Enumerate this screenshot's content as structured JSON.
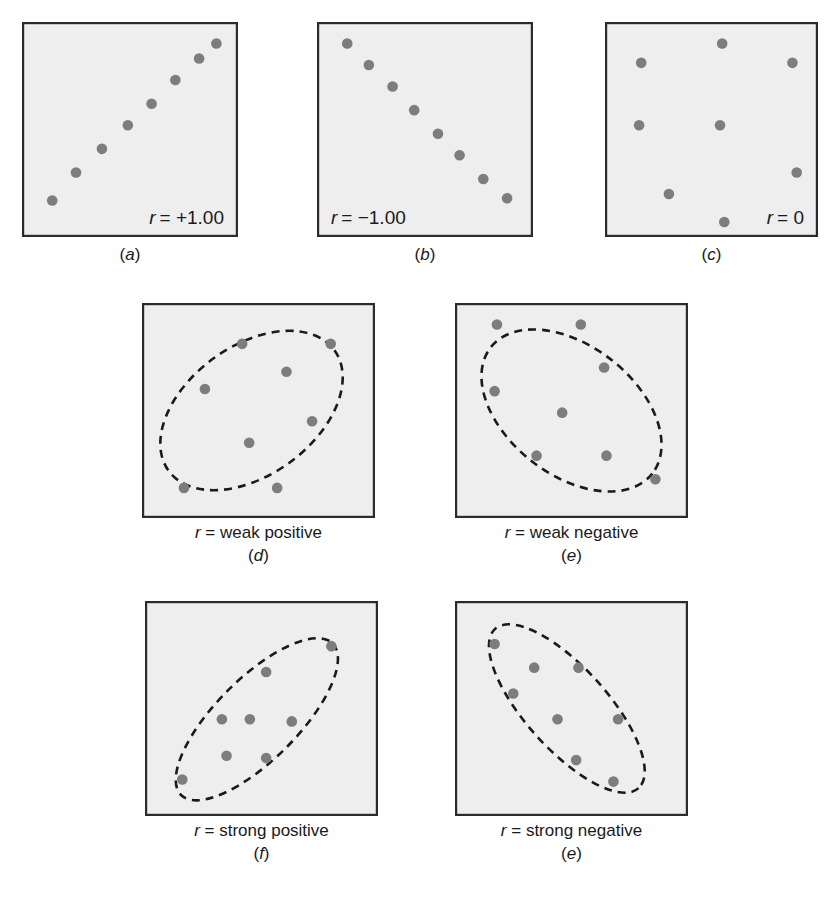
{
  "figure": {
    "panel_fill": "#eeeeee",
    "panel_border": "#2b2b2b",
    "dot_color": "#7d7d7d",
    "ellipse_color": "#1a1a1a",
    "background": "#ffffff"
  },
  "panels": [
    {
      "id": "a",
      "letter": "(a)",
      "letter_italic": "a",
      "inside_label_var": "r",
      "inside_label_value": "= +1.00",
      "inside_label_full": "r = +1.00",
      "inside_label_pos": "bottom-right",
      "desc": "",
      "ellipse": null,
      "box": {
        "x": 22,
        "y": 22,
        "w": 216,
        "h": 215
      },
      "points": [
        {
          "x": 0.14,
          "y": 0.83
        },
        {
          "x": 0.25,
          "y": 0.7
        },
        {
          "x": 0.37,
          "y": 0.59
        },
        {
          "x": 0.49,
          "y": 0.48
        },
        {
          "x": 0.6,
          "y": 0.38
        },
        {
          "x": 0.71,
          "y": 0.27
        },
        {
          "x": 0.82,
          "y": 0.17
        },
        {
          "x": 0.9,
          "y": 0.1
        }
      ]
    },
    {
      "id": "b",
      "letter": "(b)",
      "letter_italic": "b",
      "inside_label_var": "r",
      "inside_label_value": "= −1.00",
      "inside_label_full": "r = −1.00",
      "inside_label_pos": "bottom-left",
      "desc": "",
      "ellipse": null,
      "box": {
        "x": 317,
        "y": 22,
        "w": 216,
        "h": 215
      },
      "points": [
        {
          "x": 0.14,
          "y": 0.1
        },
        {
          "x": 0.24,
          "y": 0.2
        },
        {
          "x": 0.35,
          "y": 0.3
        },
        {
          "x": 0.45,
          "y": 0.41
        },
        {
          "x": 0.56,
          "y": 0.52
        },
        {
          "x": 0.66,
          "y": 0.62
        },
        {
          "x": 0.77,
          "y": 0.73
        },
        {
          "x": 0.88,
          "y": 0.82
        }
      ]
    },
    {
      "id": "c",
      "letter": "(c)",
      "letter_italic": "c",
      "inside_label_var": "r",
      "inside_label_value": "= 0",
      "inside_label_full": "r = 0",
      "inside_label_pos": "bottom-right",
      "desc": "",
      "ellipse": null,
      "box": {
        "x": 605,
        "y": 22,
        "w": 213,
        "h": 215
      },
      "points": [
        {
          "x": 0.55,
          "y": 0.1
        },
        {
          "x": 0.17,
          "y": 0.19
        },
        {
          "x": 0.88,
          "y": 0.19
        },
        {
          "x": 0.16,
          "y": 0.48
        },
        {
          "x": 0.54,
          "y": 0.48
        },
        {
          "x": 0.9,
          "y": 0.7
        },
        {
          "x": 0.3,
          "y": 0.8
        },
        {
          "x": 0.56,
          "y": 0.93
        }
      ]
    },
    {
      "id": "d",
      "letter": "(d)",
      "letter_italic": "d",
      "inside_label_var": "",
      "inside_label_value": "",
      "inside_label_full": "",
      "inside_label_pos": "none",
      "desc_var": "r",
      "desc_value": "= weak positive",
      "desc": "r = weak positive",
      "ellipse": {
        "cx": 0.47,
        "cy": 0.5,
        "rx": 0.44,
        "ry": 0.3,
        "rot": -36
      },
      "box": {
        "x": 142,
        "y": 303,
        "w": 233,
        "h": 215
      },
      "points": [
        {
          "x": 0.43,
          "y": 0.19
        },
        {
          "x": 0.81,
          "y": 0.19
        },
        {
          "x": 0.62,
          "y": 0.32
        },
        {
          "x": 0.27,
          "y": 0.4
        },
        {
          "x": 0.73,
          "y": 0.55
        },
        {
          "x": 0.46,
          "y": 0.65
        },
        {
          "x": 0.18,
          "y": 0.86
        },
        {
          "x": 0.58,
          "y": 0.86
        }
      ]
    },
    {
      "id": "e",
      "letter": "(e)",
      "letter_italic": "e",
      "inside_label_var": "",
      "inside_label_value": "",
      "inside_label_full": "",
      "inside_label_pos": "none",
      "desc_var": "r",
      "desc_value": "= weak negative",
      "desc": "r = weak negative",
      "ellipse": {
        "cx": 0.5,
        "cy": 0.5,
        "rx": 0.44,
        "ry": 0.3,
        "rot": 38
      },
      "box": {
        "x": 455,
        "y": 303,
        "w": 233,
        "h": 215
      },
      "points": [
        {
          "x": 0.18,
          "y": 0.1
        },
        {
          "x": 0.54,
          "y": 0.1
        },
        {
          "x": 0.64,
          "y": 0.3
        },
        {
          "x": 0.17,
          "y": 0.41
        },
        {
          "x": 0.46,
          "y": 0.51
        },
        {
          "x": 0.35,
          "y": 0.71
        },
        {
          "x": 0.65,
          "y": 0.71
        },
        {
          "x": 0.86,
          "y": 0.82
        }
      ]
    },
    {
      "id": "f",
      "letter": "(f)",
      "letter_italic": "f",
      "inside_label_var": "",
      "inside_label_value": "",
      "inside_label_full": "",
      "inside_label_pos": "none",
      "desc_var": "r",
      "desc_value": "= strong positive",
      "desc": "r = strong positive",
      "ellipse": {
        "cx": 0.48,
        "cy": 0.55,
        "rx": 0.46,
        "ry": 0.19,
        "rot": -45
      },
      "box": {
        "x": 145,
        "y": 601,
        "w": 233,
        "h": 215
      },
      "points": [
        {
          "x": 0.8,
          "y": 0.21
        },
        {
          "x": 0.52,
          "y": 0.33
        },
        {
          "x": 0.33,
          "y": 0.55
        },
        {
          "x": 0.45,
          "y": 0.55
        },
        {
          "x": 0.63,
          "y": 0.56
        },
        {
          "x": 0.35,
          "y": 0.72
        },
        {
          "x": 0.52,
          "y": 0.73
        },
        {
          "x": 0.16,
          "y": 0.83
        }
      ]
    },
    {
      "id": "g",
      "letter": "(e)",
      "letter_italic": "e",
      "inside_label_var": "",
      "inside_label_value": "",
      "inside_label_full": "",
      "inside_label_pos": "none",
      "desc_var": "r",
      "desc_value": "= strong negative",
      "desc": "r = strong negative",
      "ellipse": {
        "cx": 0.48,
        "cy": 0.5,
        "rx": 0.46,
        "ry": 0.19,
        "rot": 48
      },
      "box": {
        "x": 455,
        "y": 601,
        "w": 233,
        "h": 215
      },
      "points": [
        {
          "x": 0.17,
          "y": 0.2
        },
        {
          "x": 0.34,
          "y": 0.31
        },
        {
          "x": 0.53,
          "y": 0.31
        },
        {
          "x": 0.25,
          "y": 0.43
        },
        {
          "x": 0.44,
          "y": 0.55
        },
        {
          "x": 0.7,
          "y": 0.55
        },
        {
          "x": 0.52,
          "y": 0.74
        },
        {
          "x": 0.68,
          "y": 0.84
        }
      ]
    }
  ],
  "chart_data": {
    "type": "scatter",
    "xlabel": "",
    "ylabel": "",
    "xlim": [
      0,
      1
    ],
    "ylim": [
      0,
      1
    ],
    "grid": false,
    "legend": "none",
    "panels": [
      {
        "label": "(a)",
        "annotation": "r = +1.00",
        "r_value": 1.0,
        "n_points": 8,
        "x": [
          0.14,
          0.25,
          0.37,
          0.49,
          0.6,
          0.71,
          0.82,
          0.9
        ],
        "y": [
          0.17,
          0.3,
          0.41,
          0.52,
          0.62,
          0.73,
          0.83,
          0.9
        ],
        "envelope": null
      },
      {
        "label": "(b)",
        "annotation": "r = −1.00",
        "r_value": -1.0,
        "n_points": 8,
        "x": [
          0.14,
          0.24,
          0.35,
          0.45,
          0.56,
          0.66,
          0.77,
          0.88
        ],
        "y": [
          0.9,
          0.8,
          0.7,
          0.59,
          0.48,
          0.38,
          0.27,
          0.18
        ],
        "envelope": null
      },
      {
        "label": "(c)",
        "annotation": "r = 0",
        "r_value": 0.0,
        "n_points": 8,
        "x": [
          0.55,
          0.17,
          0.88,
          0.16,
          0.54,
          0.9,
          0.3,
          0.56
        ],
        "y": [
          0.9,
          0.81,
          0.81,
          0.52,
          0.52,
          0.3,
          0.2,
          0.07
        ],
        "envelope": null
      },
      {
        "label": "(d)",
        "annotation": "r = weak positive",
        "r_value": 0.45,
        "n_points": 8,
        "x": [
          0.43,
          0.81,
          0.62,
          0.27,
          0.73,
          0.46,
          0.18,
          0.58
        ],
        "y": [
          0.81,
          0.81,
          0.68,
          0.6,
          0.45,
          0.35,
          0.14,
          0.14
        ],
        "envelope": "dashed ellipse, positive tilt, wide"
      },
      {
        "label": "(e)",
        "annotation": "r = weak negative",
        "r_value": -0.45,
        "n_points": 8,
        "x": [
          0.18,
          0.54,
          0.64,
          0.17,
          0.46,
          0.35,
          0.65,
          0.86
        ],
        "y": [
          0.9,
          0.9,
          0.7,
          0.59,
          0.49,
          0.29,
          0.29,
          0.18
        ],
        "envelope": "dashed ellipse, negative tilt, wide"
      },
      {
        "label": "(f)",
        "annotation": "r = strong positive",
        "r_value": 0.9,
        "n_points": 8,
        "x": [
          0.8,
          0.52,
          0.33,
          0.45,
          0.63,
          0.35,
          0.52,
          0.16
        ],
        "y": [
          0.79,
          0.67,
          0.45,
          0.45,
          0.44,
          0.28,
          0.27,
          0.17
        ],
        "envelope": "dashed ellipse, positive tilt, narrow"
      },
      {
        "label": "(e)",
        "annotation": "r = strong negative",
        "r_value": -0.9,
        "n_points": 8,
        "x": [
          0.17,
          0.34,
          0.53,
          0.25,
          0.44,
          0.7,
          0.52,
          0.68
        ],
        "y": [
          0.8,
          0.69,
          0.69,
          0.57,
          0.45,
          0.45,
          0.26,
          0.16
        ],
        "envelope": "dashed ellipse, negative tilt, narrow"
      }
    ]
  }
}
